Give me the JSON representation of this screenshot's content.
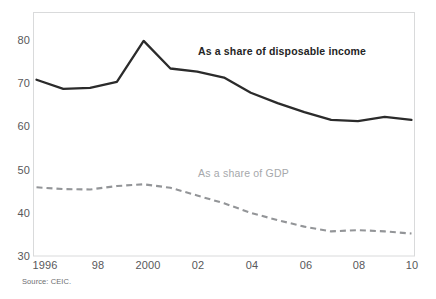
{
  "chart_data": {
    "type": "line",
    "title": "",
    "subtitle": "",
    "xlabel": "",
    "ylabel": "",
    "x": [
      1996,
      1997,
      1998,
      1999,
      2000,
      2001,
      2002,
      2003,
      2004,
      2005,
      2006,
      2007,
      2008,
      2009,
      2010
    ],
    "xlim": [
      1996,
      2010
    ],
    "ylim": [
      30,
      80
    ],
    "y_ticks": [
      30,
      40,
      50,
      60,
      70,
      80
    ],
    "y_tick_labels": [
      "30",
      "40",
      "50",
      "60",
      "70",
      "80"
    ],
    "x_ticks": [
      1996,
      1998,
      2000,
      2002,
      2004,
      2006,
      2008,
      2010
    ],
    "x_tick_labels": [
      "1996",
      "98",
      "2000",
      "02",
      "04",
      "06",
      "08",
      "10"
    ],
    "grid": false,
    "legend_position": "inline-annotation",
    "series": [
      {
        "name": "As a share of disposable income",
        "style": "solid",
        "color": "#2b2b2b",
        "values": [
          70.8,
          68.7,
          68.9,
          70.3,
          79.8,
          73.4,
          72.7,
          71.3,
          67.8,
          65.4,
          63.3,
          61.5,
          61.2,
          62.2,
          61.5
        ]
      },
      {
        "name": "As a share of GDP",
        "style": "dashed",
        "color": "#939598",
        "values": [
          45.9,
          45.5,
          45.4,
          46.2,
          46.6,
          45.8,
          44.0,
          42.2,
          40.0,
          38.3,
          36.8,
          35.7,
          36.0,
          35.7,
          35.2
        ]
      }
    ],
    "annotations": [
      {
        "text": "As a share of disposable income",
        "x": 2002.0,
        "y": 76.2,
        "color": "#242424",
        "bold": true
      },
      {
        "text": "As a share of GDP",
        "x": 2002.1,
        "y": 48.3,
        "color": "#a6a8ab",
        "bold": false
      }
    ]
  },
  "source": {
    "text": "Source: CEIC."
  },
  "colors": {
    "frame": "#d9dadb",
    "tick_text": "#58585a",
    "series_dark": "#2b2b2b",
    "series_gray": "#939598",
    "label_gray": "#a6a8ab",
    "background": "#ffffff"
  },
  "axis": {
    "y_labels": [
      "80",
      "70",
      "60",
      "50",
      "40",
      "30"
    ],
    "x_labels": [
      "1996",
      "98",
      "2000",
      "02",
      "04",
      "06",
      "08",
      "10"
    ]
  }
}
